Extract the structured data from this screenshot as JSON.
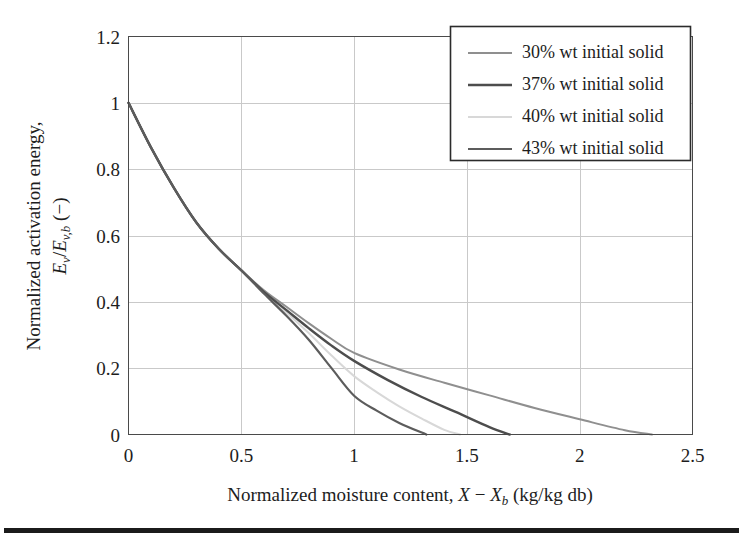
{
  "figure": {
    "background_color": "#ffffff",
    "bottom_rule_color": "#1b1b1b"
  },
  "chart_data": {
    "type": "line",
    "title": "",
    "xlabel": "Normalized moisture content, X − Xb (kg/kg db)",
    "ylabel": "Normalized activation energy, Ev/Ev,b (−)",
    "xlim": [
      0,
      2.5
    ],
    "ylim": [
      0,
      1.2
    ],
    "xticks": [
      "0",
      "0.5",
      "1",
      "1.5",
      "2",
      "2.5"
    ],
    "xtick_values": [
      0,
      0.5,
      1,
      1.5,
      2,
      2.5
    ],
    "yticks": [
      "0",
      "0.2",
      "0.4",
      "0.6",
      "0.8",
      "1",
      "1.2"
    ],
    "ytick_values": [
      0,
      0.2,
      0.4,
      0.6,
      0.8,
      1,
      1.2
    ],
    "grid": true,
    "grid_color": "#c9c9c9",
    "legend_position": "top-right",
    "series": [
      {
        "name": "30% wt initial solid",
        "color": "#8f8f8f",
        "width": 2.0,
        "x_intercept": 2.32,
        "x": [
          0,
          0.1,
          0.2,
          0.3,
          0.4,
          0.5,
          0.6,
          0.7,
          0.8,
          0.9,
          1.0,
          1.2,
          1.4,
          1.6,
          1.8,
          2.0,
          2.2,
          2.32
        ],
        "values": [
          1.0,
          0.865,
          0.745,
          0.64,
          0.56,
          0.495,
          0.435,
          0.385,
          0.335,
          0.288,
          0.246,
          0.196,
          0.156,
          0.118,
          0.08,
          0.046,
          0.013,
          0.0
        ]
      },
      {
        "name": "37% wt initial solid",
        "color": "#4d4d4d",
        "width": 2.4,
        "x_intercept": 1.69,
        "x": [
          0,
          0.1,
          0.2,
          0.3,
          0.4,
          0.5,
          0.6,
          0.7,
          0.8,
          0.9,
          1.0,
          1.15,
          1.3,
          1.45,
          1.6,
          1.69
        ],
        "values": [
          1.0,
          0.865,
          0.745,
          0.64,
          0.56,
          0.495,
          0.43,
          0.375,
          0.32,
          0.268,
          0.222,
          0.164,
          0.113,
          0.068,
          0.022,
          0.0
        ]
      },
      {
        "name": "40% wt initial solid",
        "color": "#d8d8d8",
        "width": 2.0,
        "x_intercept": 1.47,
        "x": [
          0,
          0.1,
          0.2,
          0.3,
          0.4,
          0.5,
          0.6,
          0.7,
          0.8,
          0.9,
          1.0,
          1.1,
          1.2,
          1.3,
          1.4,
          1.47
        ],
        "values": [
          1.0,
          0.865,
          0.745,
          0.64,
          0.56,
          0.495,
          0.428,
          0.368,
          0.305,
          0.238,
          0.176,
          0.128,
          0.085,
          0.048,
          0.014,
          0.0
        ]
      },
      {
        "name": "43% wt initial solid",
        "color": "#5c5c5c",
        "width": 2.2,
        "x_intercept": 1.32,
        "x": [
          0,
          0.1,
          0.2,
          0.3,
          0.4,
          0.5,
          0.6,
          0.7,
          0.8,
          0.9,
          1.0,
          1.1,
          1.2,
          1.32
        ],
        "values": [
          1.0,
          0.865,
          0.745,
          0.64,
          0.56,
          0.495,
          0.425,
          0.358,
          0.285,
          0.2,
          0.117,
          0.072,
          0.035,
          0.0
        ]
      }
    ]
  },
  "legend": {
    "entries": [
      {
        "label": "30% wt initial solid",
        "color": "#8f8f8f",
        "width": 2.0
      },
      {
        "label": "37% wt initial solid",
        "color": "#4d4d4d",
        "width": 2.6
      },
      {
        "label": "40% wt initial solid",
        "color": "#d8d8d8",
        "width": 2.0
      },
      {
        "label": "43% wt initial solid",
        "color": "#5c5c5c",
        "width": 2.2
      }
    ]
  },
  "axis_titles": {
    "x_parts": {
      "lead": "Normalized moisture content, ",
      "sym1": "X",
      "minus": " − ",
      "sym2": "X",
      "sub2": "b",
      "tail": " (kg/kg db)"
    },
    "y_line1": "Normalized activation energy,",
    "y_parts": {
      "sym1": "E",
      "sub1": "v",
      "slash": "/",
      "sym2": "E",
      "sub2": "v,b",
      "tail": " (−)"
    }
  }
}
